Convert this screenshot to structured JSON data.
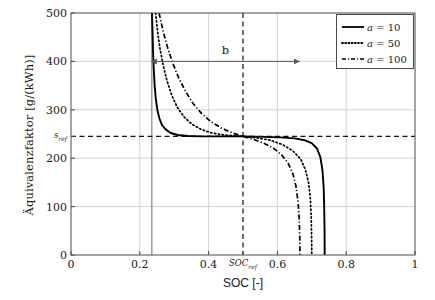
{
  "chart_data": {
    "type": "line",
    "title": "",
    "xlabel": "SOC [-]",
    "ylabel": "Äquivalenzfaktor [g/(kWh)]",
    "xlim": [
      0,
      1
    ],
    "ylim": [
      0,
      500
    ],
    "grid": true,
    "xticks": [
      "0",
      "0.2",
      "0.4",
      "0.6",
      "0.8",
      "1"
    ],
    "xtick_values": [
      0,
      0.2,
      0.4,
      0.6,
      0.8,
      1
    ],
    "yticks": [
      "0",
      "100",
      "200",
      "300",
      "400",
      "500"
    ],
    "ytick_values": [
      0,
      100,
      200,
      300,
      400,
      500
    ],
    "special_ytick": {
      "label": "s",
      "sub": "ref",
      "value": 245
    },
    "special_xtick": {
      "label": "SOC",
      "sub": "ref",
      "value": 0.5
    },
    "legend_position": "top-right",
    "series": [
      {
        "name": "a = 10",
        "param": "a",
        "value": 10,
        "style": "solid",
        "color": "#000000",
        "points": [
          [
            0.2355,
            500
          ],
          [
            0.237,
            460
          ],
          [
            0.2385,
            420
          ],
          [
            0.2405,
            385
          ],
          [
            0.243,
            352
          ],
          [
            0.2465,
            323
          ],
          [
            0.251,
            300
          ],
          [
            0.257,
            282
          ],
          [
            0.265,
            268
          ],
          [
            0.276,
            259
          ],
          [
            0.29,
            252
          ],
          [
            0.31,
            248
          ],
          [
            0.34,
            246
          ],
          [
            0.38,
            245
          ],
          [
            0.43,
            245
          ],
          [
            0.5,
            245
          ],
          [
            0.56,
            244
          ],
          [
            0.61,
            243
          ],
          [
            0.65,
            241
          ],
          [
            0.68,
            237
          ],
          [
            0.7,
            231
          ],
          [
            0.715,
            220
          ],
          [
            0.725,
            202
          ],
          [
            0.731,
            175
          ],
          [
            0.7345,
            140
          ],
          [
            0.736,
            100
          ],
          [
            0.737,
            55
          ],
          [
            0.7375,
            0
          ]
        ]
      },
      {
        "name": "a = 50",
        "param": "a",
        "value": 50,
        "style": "dotted",
        "color": "#000000",
        "points": [
          [
            0.246,
            500
          ],
          [
            0.252,
            460
          ],
          [
            0.259,
            425
          ],
          [
            0.268,
            392
          ],
          [
            0.279,
            360
          ],
          [
            0.293,
            330
          ],
          [
            0.309,
            305
          ],
          [
            0.329,
            285
          ],
          [
            0.352,
            270
          ],
          [
            0.38,
            259
          ],
          [
            0.41,
            252
          ],
          [
            0.445,
            248
          ],
          [
            0.48,
            246
          ],
          [
            0.5,
            245
          ],
          [
            0.54,
            242
          ],
          [
            0.58,
            237
          ],
          [
            0.615,
            228
          ],
          [
            0.645,
            215
          ],
          [
            0.668,
            198
          ],
          [
            0.682,
            175
          ],
          [
            0.691,
            148
          ],
          [
            0.696,
            115
          ],
          [
            0.6985,
            75
          ],
          [
            0.6995,
            35
          ],
          [
            0.7,
            0
          ]
        ]
      },
      {
        "name": "a = 100",
        "param": "a",
        "value": 100,
        "style": "dashdot",
        "color": "#000000",
        "points": [
          [
            0.256,
            500
          ],
          [
            0.268,
            462
          ],
          [
            0.281,
            428
          ],
          [
            0.296,
            396
          ],
          [
            0.313,
            366
          ],
          [
            0.333,
            338
          ],
          [
            0.355,
            313
          ],
          [
            0.38,
            292
          ],
          [
            0.408,
            275
          ],
          [
            0.438,
            262
          ],
          [
            0.47,
            252
          ],
          [
            0.5,
            245
          ],
          [
            0.53,
            239
          ],
          [
            0.56,
            231
          ],
          [
            0.588,
            221
          ],
          [
            0.612,
            207
          ],
          [
            0.631,
            190
          ],
          [
            0.645,
            168
          ],
          [
            0.654,
            142
          ],
          [
            0.66,
            110
          ],
          [
            0.6635,
            75
          ],
          [
            0.665,
            38
          ],
          [
            0.6655,
            0
          ]
        ]
      }
    ],
    "reference_lines": [
      {
        "name": "soc-min-vertical",
        "orientation": "vertical",
        "value": 0.235,
        "style": "solid"
      },
      {
        "name": "s-ref-horizontal",
        "orientation": "horizontal",
        "value": 245,
        "style": "dashed"
      },
      {
        "name": "soc-ref-vertical",
        "orientation": "vertical",
        "value": 0.5,
        "style": "dashed"
      }
    ],
    "annotations": [
      {
        "name": "b-span-arrow",
        "label": "b",
        "y": 400,
        "x_start": 0.235,
        "x_end": 0.665
      }
    ]
  },
  "legend": {
    "items": [
      {
        "label_prefix": "a",
        "equals": " = ",
        "value": "10",
        "style": "solid"
      },
      {
        "label_prefix": "a",
        "equals": " = ",
        "value": "50",
        "style": "dotted"
      },
      {
        "label_prefix": "a",
        "equals": " = ",
        "value": "100",
        "style": "dashdot"
      }
    ]
  }
}
